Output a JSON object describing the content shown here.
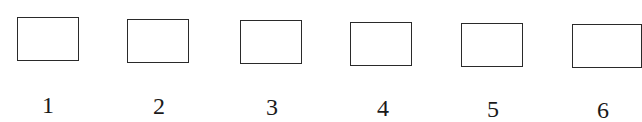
{
  "items": [
    {
      "label": "1"
    },
    {
      "label": "2"
    },
    {
      "label": "3"
    },
    {
      "label": "4"
    },
    {
      "label": "5"
    },
    {
      "label": "6"
    }
  ]
}
